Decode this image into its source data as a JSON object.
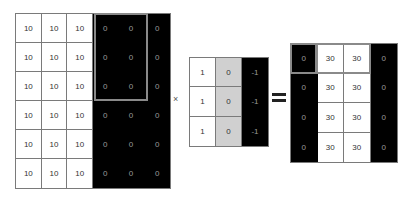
{
  "input_matrix": {
    "rows": [
      [
        "10",
        "10",
        "10",
        "0",
        "0",
        "0"
      ],
      [
        "10",
        "10",
        "10",
        "0",
        "0",
        "0"
      ],
      [
        "10",
        "10",
        "10",
        "0",
        "0",
        "0"
      ],
      [
        "10",
        "10",
        "10",
        "0",
        "0",
        "0"
      ],
      [
        "10",
        "10",
        "10",
        "0",
        "0",
        "0"
      ],
      [
        "10",
        "10",
        "10",
        "0",
        "0",
        "0"
      ]
    ],
    "shades": [
      [
        "w",
        "w",
        "w",
        "b",
        "b",
        "b"
      ],
      [
        "w",
        "w",
        "w",
        "b",
        "b",
        "b"
      ],
      [
        "w",
        "w",
        "w",
        "b",
        "b",
        "b"
      ],
      [
        "w",
        "w",
        "w",
        "b",
        "b",
        "b"
      ],
      [
        "w",
        "w",
        "w",
        "b",
        "b",
        "b"
      ],
      [
        "w",
        "w",
        "w",
        "b",
        "b",
        "b"
      ]
    ]
  },
  "operators": {
    "multiply": "×",
    "equals": "="
  },
  "kernel_matrix": {
    "rows": [
      [
        "1",
        "0",
        "-1"
      ],
      [
        "1",
        "0",
        "-1"
      ],
      [
        "1",
        "0",
        "-1"
      ]
    ],
    "shades": [
      [
        "w",
        "g",
        "b"
      ],
      [
        "w",
        "g",
        "b"
      ],
      [
        "w",
        "g",
        "b"
      ]
    ]
  },
  "output_matrix": {
    "rows": [
      [
        "0",
        "30",
        "30",
        "0"
      ],
      [
        "0",
        "30",
        "30",
        "0"
      ],
      [
        "0",
        "30",
        "30",
        "0"
      ],
      [
        "0",
        "30",
        "30",
        "0"
      ]
    ],
    "shades": [
      [
        "b",
        "w",
        "w",
        "b"
      ],
      [
        "b",
        "w",
        "w",
        "b"
      ],
      [
        "b",
        "w",
        "w",
        "b"
      ],
      [
        "b",
        "w",
        "w",
        "b"
      ]
    ]
  },
  "colors": {
    "white": "#ffffff",
    "gray": "#d0d0d0",
    "black": "#000000",
    "grid_line": "#7a7a7a",
    "highlight": "#8a8a8a"
  }
}
